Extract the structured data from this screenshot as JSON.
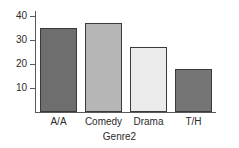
{
  "chart_data": {
    "type": "bar",
    "title": "",
    "subtitle": "",
    "xlabel": "Genre2",
    "ylabel": "",
    "categories": [
      "A/A",
      "Comedy",
      "Drama",
      "T/H"
    ],
    "values": [
      35,
      37,
      27,
      18
    ],
    "series": [
      {
        "name": "Count",
        "values": [
          35,
          37,
          27,
          18
        ]
      }
    ],
    "ylim": [
      0,
      42
    ],
    "yticks": [
      10,
      20,
      30,
      40
    ],
    "ytick_labels": [
      "10",
      "20",
      "30",
      "40"
    ],
    "xticks": [
      "A/A",
      "Comedy",
      "Drama",
      "T/H"
    ],
    "grid": false,
    "legend": false,
    "legend_position": "none",
    "annotations": [],
    "bar_colors": [
      "#6e6e6e",
      "#b6b6b6",
      "#ebebeb",
      "#757575"
    ],
    "bar_edge_color": "#3a3a3a",
    "axis_color": "#5a5a5a",
    "background_color": "#ffffff"
  }
}
